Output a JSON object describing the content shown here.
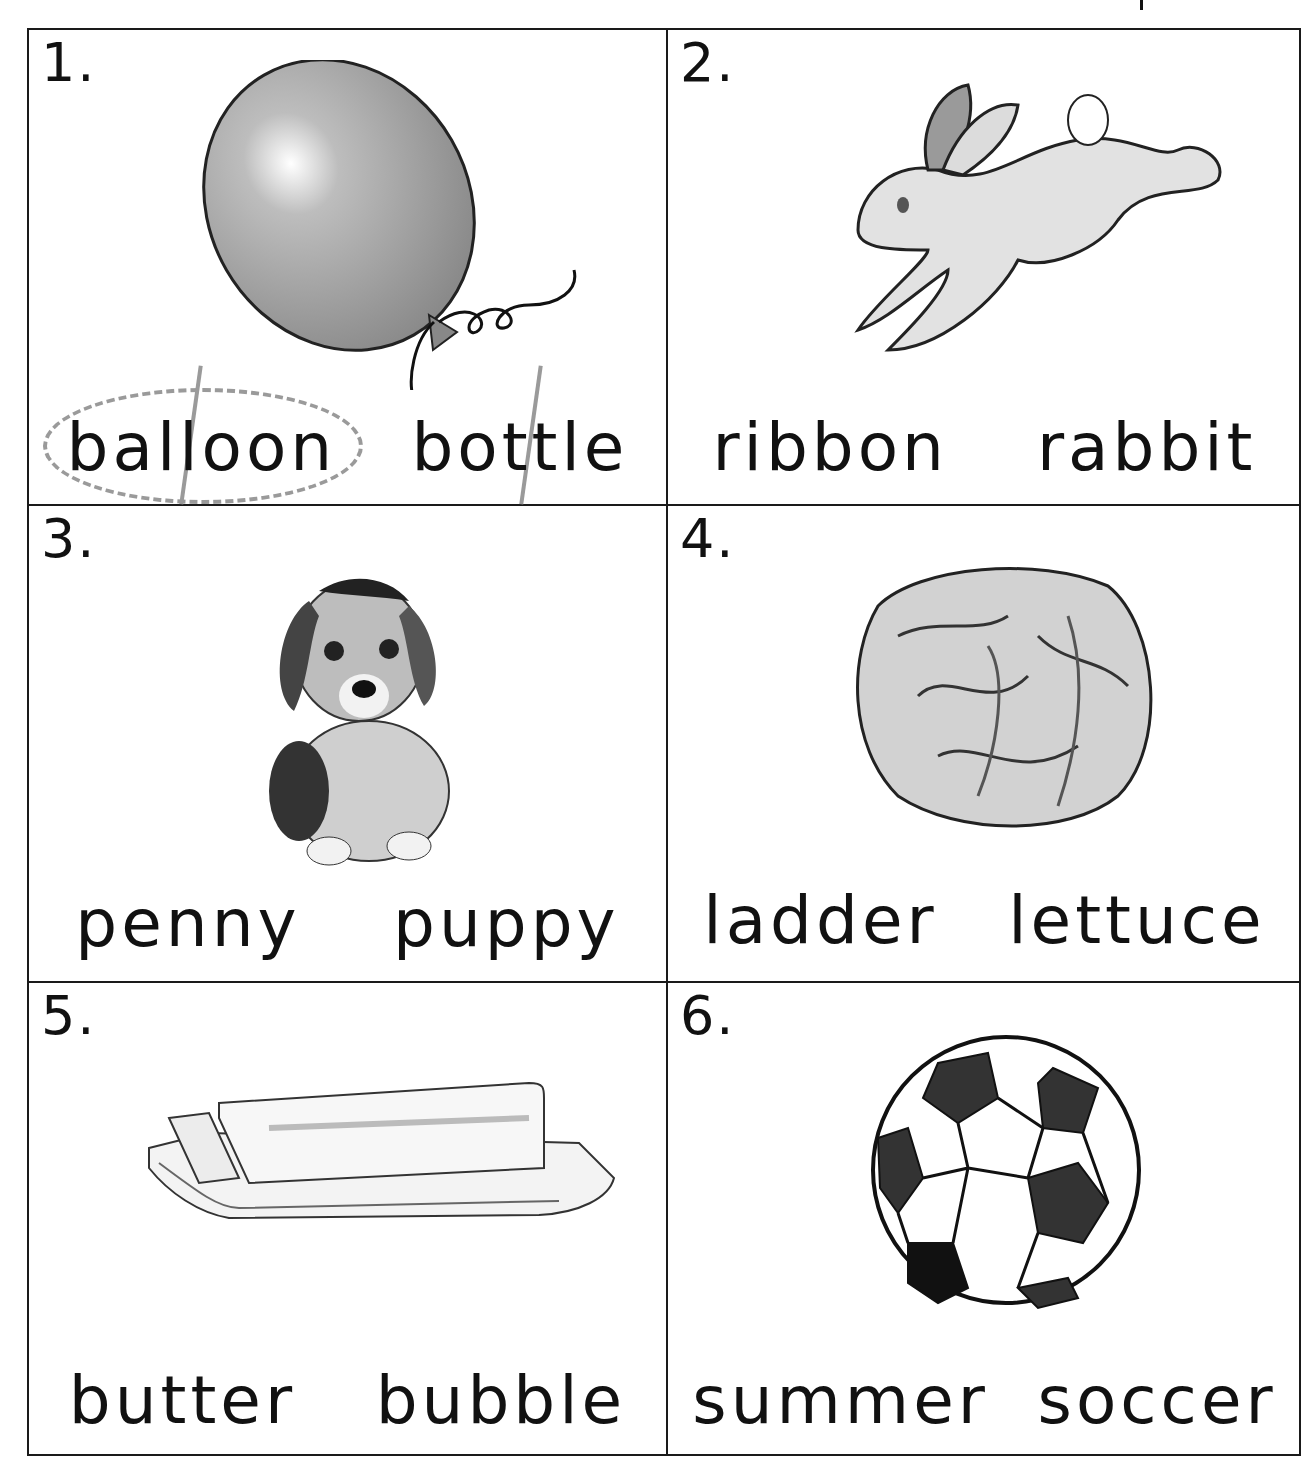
{
  "worksheet": {
    "cells": [
      {
        "number": "1.",
        "picture": "balloon",
        "words": [
          "balloon",
          "bottle"
        ],
        "circled": "balloon"
      },
      {
        "number": "2.",
        "picture": "rabbit",
        "words": [
          "ribbon",
          "rabbit"
        ]
      },
      {
        "number": "3.",
        "picture": "puppy",
        "words": [
          "penny",
          "puppy"
        ]
      },
      {
        "number": "4.",
        "picture": "lettuce",
        "words": [
          "ladder",
          "lettuce"
        ]
      },
      {
        "number": "5.",
        "picture": "butter",
        "words": [
          "butter",
          "bubble"
        ]
      },
      {
        "number": "6.",
        "picture": "soccer ball",
        "words": [
          "summer",
          "soccer"
        ]
      }
    ]
  }
}
